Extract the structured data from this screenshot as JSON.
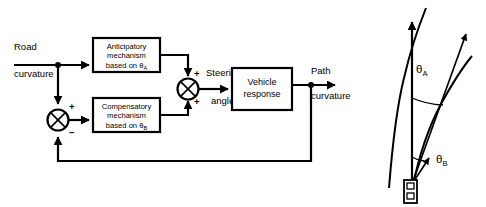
{
  "figure": {
    "background_color": "#ffffff",
    "line_color": "#000000",
    "width": 486,
    "height": 207
  },
  "block_diagram": {
    "input_label_line1": "Road",
    "input_label_line2": "curvature",
    "output_label_line1": "Path",
    "output_label_line2": "curvature",
    "blocks": [
      {
        "id": "anticipatory",
        "line1": "Anticipatory",
        "line2": "mechanism",
        "line3_prefix": "based on ",
        "line3_symbol": "θ",
        "line3_subscript": "A"
      },
      {
        "id": "compensatory",
        "line1": "Compensatory",
        "line2": "mechanism",
        "line3_prefix": "based on ",
        "line3_symbol": "θ",
        "line3_subscript": "B"
      },
      {
        "id": "vehicle",
        "line1": "Vehicle",
        "line2": "response"
      }
    ],
    "summing_junctions": [
      {
        "id": "error-junction",
        "sign_top": "+",
        "sign_bottom": "−"
      },
      {
        "id": "steering-junction",
        "sign_top": "+",
        "sign_bottom": "+",
        "label_line1": "Steering",
        "label_line2": "angle"
      }
    ],
    "feedback_present": true
  },
  "road_geometry": {
    "angle_far_symbol": "θ",
    "angle_far_subscript": "A",
    "angle_near_symbol": "θ",
    "angle_near_subscript": "B",
    "heading_arrow": "vehicle-heading-arrow",
    "vehicle_marker": "car-icon",
    "road_edges": 2,
    "sight_rays": 2
  }
}
